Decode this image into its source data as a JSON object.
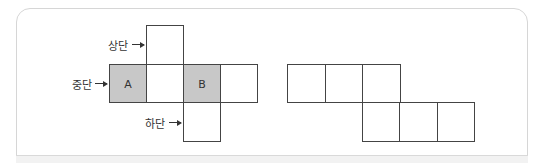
{
  "figure_left": {
    "labels": {
      "top": "상단",
      "middle": "중단",
      "bottom": "하단"
    },
    "cells": {
      "a": "A",
      "b": "B"
    },
    "shaded_color": "#c8c8c8"
  },
  "figure_right": {
    "description": "cube net with 6 squares in two staggered rows of three"
  }
}
